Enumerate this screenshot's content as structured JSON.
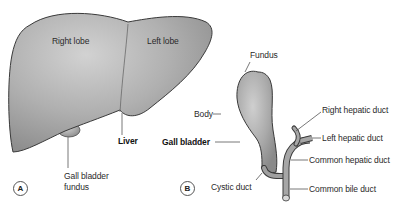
{
  "panels": {
    "a": {
      "marker": "A",
      "labels": {
        "right_lobe": "Right lobe",
        "left_lobe": "Left lobe",
        "liver": "Liver",
        "gall_bladder_fundus_line1": "Gall bladder",
        "gall_bladder_fundus_line2": "fundus"
      }
    },
    "b": {
      "marker": "B",
      "labels": {
        "fundus": "Fundus",
        "body": "Body",
        "gall_bladder": "Gall bladder",
        "cystic_duct": "Cystic duct",
        "right_hepatic_duct": "Right hepatic duct",
        "left_hepatic_duct": "Left hepatic duct",
        "common_hepatic_duct": "Common hepatic duct",
        "common_bile_duct": "Common bile duct"
      }
    }
  },
  "colors": {
    "organ_fill": "#a8a8a8",
    "organ_highlight": "#d4d4d4",
    "outline": "#3a3a3a",
    "leader_line": "#555555"
  }
}
